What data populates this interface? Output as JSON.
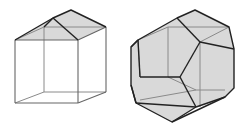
{
  "diagram": {
    "type": "polyhedra-comparison",
    "figures": [
      {
        "name": "cube-with-roof",
        "description": "Wireframe cube with a gabled (hipped) roof on top; roof faces shaded gray"
      },
      {
        "name": "truncated-polyhedron",
        "description": "Shaded polyhedron (cube with edges/corners truncated, showing pentagonal faces)"
      }
    ],
    "colors": {
      "background": "#ffffff",
      "face_fill": "#d9d9d9",
      "thin_edge": "#777777",
      "bold_edge": "#222222"
    }
  }
}
